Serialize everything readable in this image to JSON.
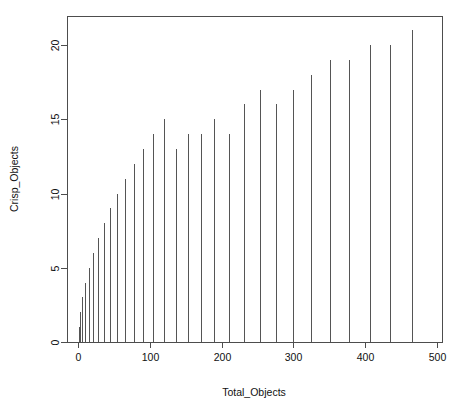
{
  "chart_data": {
    "type": "bar",
    "subtype": "spike-plot",
    "title": "",
    "xlabel": "Total_Objects",
    "ylabel": "Crisp_Objects",
    "xlim": [
      0,
      500
    ],
    "ylim": [
      0,
      21
    ],
    "xticks": [
      0,
      100,
      200,
      300,
      400,
      500
    ],
    "xtick_labels": [
      "0",
      "100",
      "200",
      "300",
      "400",
      "500"
    ],
    "yticks": [
      0,
      5,
      10,
      15,
      20
    ],
    "ytick_labels": [
      "0",
      "5",
      "10",
      "15",
      "20"
    ],
    "grid": false,
    "legend": null,
    "series_color": "#555555",
    "x": [
      1,
      3,
      6,
      10,
      15,
      21,
      28,
      36,
      45,
      55,
      66,
      78,
      91,
      105,
      120,
      136,
      153,
      171,
      190,
      210,
      231,
      253,
      276,
      300,
      325,
      351,
      378,
      406,
      435,
      465
    ],
    "values": [
      1,
      2,
      3,
      4,
      5,
      6,
      7,
      8,
      9,
      10,
      11,
      12,
      13,
      14,
      15,
      16,
      17,
      18,
      19,
      20,
      21,
      6,
      9,
      12,
      14,
      16,
      17,
      18,
      19,
      20
    ],
    "points": [
      {
        "x": 1,
        "y": 1
      },
      {
        "x": 3,
        "y": 2
      },
      {
        "x": 6,
        "y": 3
      },
      {
        "x": 10,
        "y": 4
      },
      {
        "x": 15,
        "y": 5
      },
      {
        "x": 21,
        "y": 6
      },
      {
        "x": 28,
        "y": 7
      },
      {
        "x": 36,
        "y": 8
      },
      {
        "x": 45,
        "y": 9
      },
      {
        "x": 55,
        "y": 10
      },
      {
        "x": 66,
        "y": 11
      },
      {
        "x": 78,
        "y": 12
      },
      {
        "x": 91,
        "y": 13
      },
      {
        "x": 105,
        "y": 14
      },
      {
        "x": 120,
        "y": 15
      },
      {
        "x": 136,
        "y": 13
      },
      {
        "x": 153,
        "y": 14
      },
      {
        "x": 171,
        "y": 14
      },
      {
        "x": 190,
        "y": 15
      },
      {
        "x": 210,
        "y": 14
      },
      {
        "x": 231,
        "y": 16
      },
      {
        "x": 253,
        "y": 17
      },
      {
        "x": 276,
        "y": 16
      },
      {
        "x": 300,
        "y": 17
      },
      {
        "x": 325,
        "y": 18
      },
      {
        "x": 351,
        "y": 19
      },
      {
        "x": 378,
        "y": 19
      },
      {
        "x": 406,
        "y": 20
      },
      {
        "x": 435,
        "y": 20
      },
      {
        "x": 465,
        "y": 21
      }
    ]
  },
  "figure": {
    "plot_box": {
      "left": 67,
      "top": 16,
      "right": 442,
      "bottom": 342
    },
    "background": "#ffffff",
    "axis_color": "#4d4d4d"
  }
}
